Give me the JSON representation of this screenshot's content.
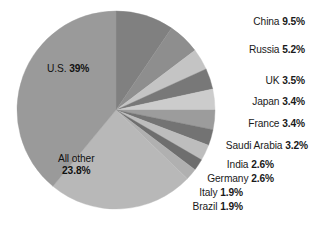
{
  "chart_data": {
    "type": "pie",
    "title": "",
    "subtitle": "",
    "xlabel": "",
    "ylabel": "",
    "legend_position": "callout-right",
    "grid": false,
    "units": "percent",
    "start_angle_deg": 0,
    "direction": "counterclockwise-for-us-then-clockwise",
    "categories": [
      "U.S.",
      "China",
      "Russia",
      "UK",
      "Japan",
      "France",
      "Saudi Arabia",
      "India",
      "Germany",
      "Italy",
      "Brazil",
      "All other"
    ],
    "values": [
      39,
      9.5,
      5.2,
      3.5,
      3.4,
      3.4,
      3.2,
      2.6,
      2.6,
      1.9,
      1.9,
      23.8
    ],
    "slices": [
      {
        "name": "U.S.",
        "value": 39,
        "value_text": "39%",
        "color": "#9a9a9a",
        "label_style": "inside",
        "label_lines": 1
      },
      {
        "name": "China",
        "value": 9.5,
        "value_text": "9.5%",
        "color": "#808080",
        "label_style": "callout",
        "label_lines": 1
      },
      {
        "name": "Russia",
        "value": 5.2,
        "value_text": "5.2%",
        "color": "#8e8e8e",
        "label_style": "callout",
        "label_lines": 1
      },
      {
        "name": "UK",
        "value": 3.5,
        "value_text": "3.5%",
        "color": "#c4c4c4",
        "label_style": "callout",
        "label_lines": 1
      },
      {
        "name": "Japan",
        "value": 3.4,
        "value_text": "3.4%",
        "color": "#787878",
        "label_style": "callout",
        "label_lines": 1
      },
      {
        "name": "France",
        "value": 3.4,
        "value_text": "3.4%",
        "color": "#cccccc",
        "label_style": "callout",
        "label_lines": 1
      },
      {
        "name": "Saudi Arabia",
        "value": 3.2,
        "value_text": "3.2%",
        "color": "#9c9c9c",
        "label_style": "callout",
        "label_lines": 1
      },
      {
        "name": "India",
        "value": 2.6,
        "value_text": "2.6%",
        "color": "#737373",
        "label_style": "callout",
        "label_lines": 1
      },
      {
        "name": "Germany",
        "value": 2.6,
        "value_text": "2.6%",
        "color": "#bdbdbd",
        "label_style": "callout",
        "label_lines": 1
      },
      {
        "name": "Italy",
        "value": 1.9,
        "value_text": "1.9%",
        "color": "#6e6e6e",
        "label_style": "callout",
        "label_lines": 1
      },
      {
        "name": "Brazil",
        "value": 1.9,
        "value_text": "1.9%",
        "color": "#b0b0b0",
        "label_style": "callout",
        "label_lines": 1
      },
      {
        "name": "All other",
        "value": 23.8,
        "value_text": "23.8%",
        "color": "#b8b8b8",
        "label_style": "inside",
        "label_lines": 2
      }
    ]
  },
  "labels": {
    "inside": [
      {
        "key": "us",
        "name": "U.S.",
        "value_text": "39%",
        "x": 47,
        "y": 63,
        "lines": 1
      },
      {
        "key": "allother",
        "name": "All other",
        "value_text": "23.8%",
        "x": 58,
        "y": 153,
        "lines": 2
      }
    ],
    "callout": [
      {
        "key": "china",
        "name": "China",
        "value_text": "9.5%",
        "right": 11,
        "y": 16
      },
      {
        "key": "russia",
        "name": "Russia",
        "value_text": "5.2%",
        "right": 11,
        "y": 44
      },
      {
        "key": "uk",
        "name": "UK",
        "value_text": "3.5%",
        "right": 11,
        "y": 75
      },
      {
        "key": "japan",
        "name": "Japan",
        "value_text": "3.4%",
        "right": 11,
        "y": 96
      },
      {
        "key": "france",
        "name": "France",
        "value_text": "3.4%",
        "right": 11,
        "y": 118
      },
      {
        "key": "saudi",
        "name": "Saudi Arabia",
        "value_text": "3.2%",
        "right": 8,
        "y": 140
      },
      {
        "key": "india",
        "name": "India",
        "value_text": "2.6%",
        "right": 42,
        "y": 159
      },
      {
        "key": "germany",
        "name": "Germany",
        "value_text": "2.6%",
        "right": 42,
        "y": 173
      },
      {
        "key": "italy",
        "name": "Italy",
        "value_text": "1.9%",
        "right": 73,
        "y": 187
      },
      {
        "key": "brazil",
        "name": "Brazil",
        "value_text": "1.9%",
        "right": 73,
        "y": 201
      }
    ]
  },
  "geometry": {
    "center_x": 116,
    "center_y": 110,
    "radius": 99
  },
  "colors": {
    "background": "#ffffff",
    "text": "#1a1a1a"
  }
}
